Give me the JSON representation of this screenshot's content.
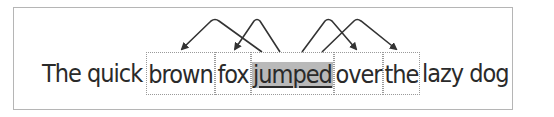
{
  "diagram": {
    "words": [
      {
        "text": "The quick",
        "type": "plain",
        "left": 42,
        "width": 104
      },
      {
        "text": "brown",
        "type": "boxed",
        "left": 146,
        "width": 69
      },
      {
        "text": "fox",
        "type": "boxed",
        "left": 215,
        "width": 36
      },
      {
        "text": "jumped",
        "type": "focus",
        "left": 251,
        "width": 83
      },
      {
        "text": "over",
        "type": "boxed",
        "left": 334,
        "width": 49
      },
      {
        "text": "the",
        "type": "boxed",
        "left": 383,
        "width": 37
      },
      {
        "text": "lazy dog",
        "type": "plain",
        "left": 422,
        "width": 90
      }
    ],
    "arrows": [
      {
        "from": "jumped",
        "to": "brown"
      },
      {
        "from": "jumped",
        "to": "fox"
      },
      {
        "from": "jumped",
        "to": "over"
      },
      {
        "from": "jumped",
        "to": "the"
      }
    ],
    "colors": {
      "highlight": "#b9b9b9",
      "arrow": "#333333",
      "box_border": "#9a9a9a"
    }
  }
}
